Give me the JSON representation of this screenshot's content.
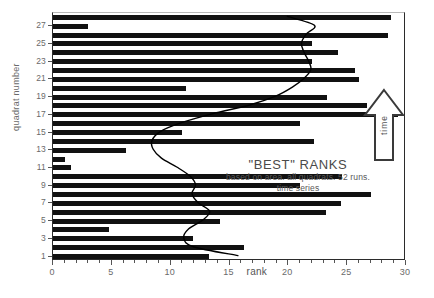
{
  "chart_data": {
    "type": "bar",
    "title": "\"BEST\" RANKS",
    "subtitle_line1": "based on area. all quadrats. 52 runs.",
    "subtitle_line2": "time series",
    "xlabel": "rank",
    "ylabel": "quadrat number",
    "xlim": [
      0,
      30
    ],
    "ylim": [
      0.5,
      28.5
    ],
    "grid": false,
    "orientation": "horizontal",
    "bar_color": "#111111",
    "line_color": "#000000",
    "categories": [
      1,
      2,
      3,
      4,
      5,
      6,
      7,
      8,
      9,
      10,
      11,
      12,
      13,
      14,
      15,
      16,
      17,
      18,
      19,
      20,
      21,
      22,
      23,
      24,
      25,
      26,
      27,
      28
    ],
    "values": [
      13.3,
      16.2,
      11.9,
      4.8,
      14.2,
      23.2,
      24.5,
      27.0,
      21.0,
      24.6,
      1.5,
      1.0,
      6.2,
      22.2,
      11.0,
      21.0,
      29.3,
      26.7,
      23.3,
      11.3,
      26.0,
      25.7,
      22.0,
      24.2,
      22.0,
      28.5,
      3.0,
      28.7
    ],
    "x_ticks": [
      0,
      5,
      10,
      15,
      20,
      25,
      30
    ],
    "x_tick_labels": [
      "0",
      "5",
      "10",
      "15",
      "20",
      "25",
      "30"
    ],
    "x_minor_tick_step": 1,
    "y_ticks": [
      1,
      3,
      5,
      7,
      9,
      11,
      13,
      15,
      17,
      19,
      21,
      23,
      25,
      27
    ],
    "y_tick_labels": [
      "1",
      "3",
      "5",
      "7",
      "9",
      "11",
      "13",
      "15",
      "17",
      "19",
      "21",
      "23",
      "25",
      "27"
    ],
    "overlay_series": {
      "name": "smoothed-trend",
      "x": [
        15.8,
        12.0,
        11.2,
        11.6,
        12.8,
        13.4,
        12.4,
        11.9,
        12.2,
        11.7,
        10.6,
        9.3,
        8.6,
        8.5,
        9.2,
        11.0,
        13.6,
        16.8,
        19.0,
        20.4,
        21.4,
        22.0,
        21.8,
        21.4,
        21.2,
        21.6,
        22.3,
        20.0
      ],
      "y": [
        1,
        2,
        3,
        4,
        5,
        6,
        7,
        8,
        9,
        10,
        11,
        12,
        13,
        14,
        15,
        16,
        17,
        18,
        19,
        20,
        21,
        22,
        23,
        24,
        25,
        26,
        27,
        28
      ]
    },
    "annotations": [
      {
        "name": "time-arrow",
        "text": "time",
        "direction": "up"
      }
    ]
  },
  "axes": {
    "y_title": "quadrat number",
    "x_title": "rank"
  }
}
